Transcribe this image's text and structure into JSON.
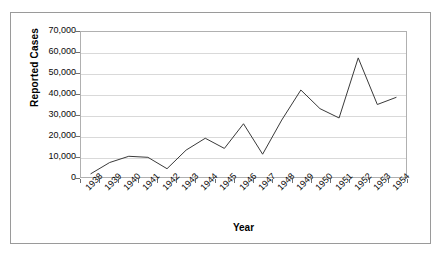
{
  "chart_data": {
    "type": "line",
    "title": "",
    "xlabel": "Year",
    "ylabel": "Reported Cases",
    "categories": [
      "1938",
      "1939",
      "1940",
      "1941",
      "1942",
      "1943",
      "1944",
      "1945",
      "1946",
      "1947",
      "1948",
      "1949",
      "1950",
      "1951",
      "1952",
      "1953",
      "1954"
    ],
    "values": [
      1500,
      7000,
      10000,
      9500,
      4000,
      13000,
      18700,
      13800,
      25700,
      11000,
      27500,
      42000,
      33000,
      28500,
      57500,
      35000,
      38500
    ],
    "series": [
      {
        "name": "Reported Cases",
        "values": [
          1500,
          7000,
          10000,
          9500,
          4000,
          13000,
          18700,
          13800,
          25700,
          11000,
          27500,
          42000,
          33000,
          28500,
          57500,
          35000,
          38500
        ],
        "color": "#3a3a3a"
      }
    ],
    "ylim": [
      0,
      70000
    ],
    "ytick_values": [
      0,
      10000,
      20000,
      30000,
      40000,
      50000,
      60000,
      70000
    ],
    "ytick_labels": [
      "0",
      "10,000",
      "20,000",
      "30,000",
      "40,000",
      "50,000",
      "60,000",
      "70,000"
    ],
    "grid": true,
    "grid_axis": "y",
    "legend": "none",
    "line_color": "#3a3a3a",
    "grid_color": "#d9d9d9",
    "axis_color": "#b0b0b0",
    "frame_color": "#9a9a9a",
    "markers": false
  }
}
